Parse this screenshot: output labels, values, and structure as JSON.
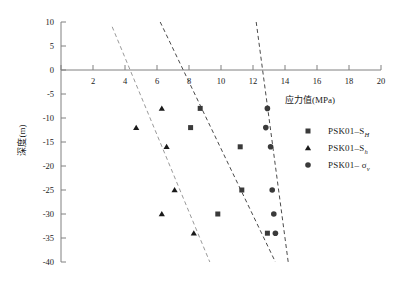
{
  "chart_data": {
    "type": "scatter",
    "title": "",
    "xlabel": "应力值(MPa)",
    "ylabel": "深度(m)",
    "xlim": [
      0,
      20
    ],
    "ylim": [
      -40,
      10
    ],
    "xticks": [
      0,
      2,
      4,
      6,
      8,
      10,
      12,
      14,
      16,
      18,
      20
    ],
    "xtick_labels": [
      "",
      "2",
      "4",
      "6",
      "8",
      "10",
      "12",
      "14",
      "16",
      "18",
      "20"
    ],
    "yticks": [
      10,
      5,
      0,
      -5,
      -10,
      -15,
      -20,
      -25,
      -30,
      -35,
      -40
    ],
    "ytick_labels": [
      "10",
      "5",
      "0",
      "-5",
      "-10",
      "-15",
      "-20",
      "-25",
      "-30",
      "-35",
      "-40"
    ],
    "grid": false,
    "legend_position": "right",
    "series": [
      {
        "name": "PSK01–S_H",
        "label_main": "PSK01–S",
        "label_sub": "H",
        "marker": "square",
        "color": "#3a3a3a",
        "points": [
          {
            "x": 8.7,
            "y": -8
          },
          {
            "x": 8.1,
            "y": -12
          },
          {
            "x": 11.2,
            "y": -16
          },
          {
            "x": 11.3,
            "y": -25
          },
          {
            "x": 9.8,
            "y": -30
          },
          {
            "x": 12.9,
            "y": -34
          }
        ]
      },
      {
        "name": "PSK01–S_h",
        "label_main": "PSK01–S",
        "label_sub": "h",
        "marker": "triangle",
        "color": "#1a1a1a",
        "points": [
          {
            "x": 6.3,
            "y": -8
          },
          {
            "x": 4.7,
            "y": -12
          },
          {
            "x": 6.6,
            "y": -16
          },
          {
            "x": 7.1,
            "y": -25
          },
          {
            "x": 6.3,
            "y": -30
          },
          {
            "x": 8.3,
            "y": -34
          }
        ]
      },
      {
        "name": "PSK01–σ_v",
        "label_main": "PSK01–",
        "label_greek": "σ",
        "label_sub": "v",
        "marker": "circle",
        "color": "#3a3a3a",
        "points": [
          {
            "x": 12.9,
            "y": -8
          },
          {
            "x": 12.8,
            "y": -12
          },
          {
            "x": 13.1,
            "y": -16
          },
          {
            "x": 13.2,
            "y": -25
          },
          {
            "x": 13.3,
            "y": -30
          },
          {
            "x": 13.4,
            "y": -34
          }
        ]
      }
    ],
    "trend_lines": [
      {
        "name": "trend-sh",
        "color": "#9a9a9a",
        "x1": 3.2,
        "y1": 9.0,
        "x2": 9.3,
        "y2": -40.0
      },
      {
        "name": "trend-sh-major",
        "color": "#4a4a4a",
        "x1": 6.2,
        "y1": 10.0,
        "x2": 13.4,
        "y2": -40.0
      },
      {
        "name": "trend-sigma-v",
        "color": "#4a4a4a",
        "x1": 12.2,
        "y1": 10.0,
        "x2": 14.2,
        "y2": -40.0
      }
    ]
  },
  "legend": {
    "entries": [
      {
        "symbol": "square-marker-icon",
        "text": "PSK01–S",
        "sub": "H"
      },
      {
        "symbol": "triangle-marker-icon",
        "text": "PSK01–S",
        "sub": "h"
      },
      {
        "symbol": "circle-marker-icon",
        "text": "PSK01– σ",
        "sub": "v"
      }
    ]
  },
  "colors": {
    "axis": "#808080",
    "text": "#1a1a1a",
    "marker_dark": "#1a1a1a",
    "marker_gray": "#3a3a3a",
    "trend_light": "#9a9a9a",
    "trend_dark": "#4a4a4a",
    "background": "#ffffff"
  }
}
